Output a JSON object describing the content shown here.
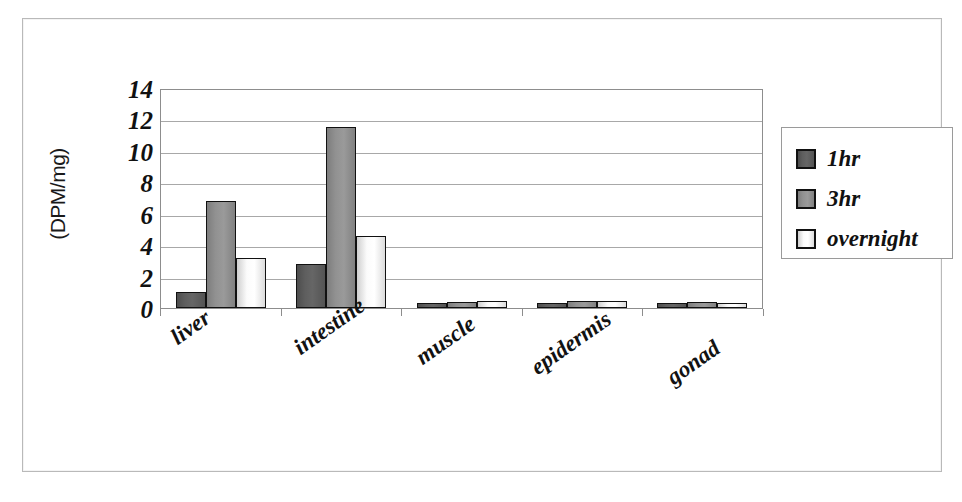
{
  "chart_data": {
    "type": "bar",
    "title": "",
    "xlabel": "",
    "ylabel": "(DPM/mg)",
    "ylim": [
      0,
      14
    ],
    "ytick_step": 2,
    "yticks": [
      14,
      12,
      10,
      8,
      6,
      4,
      2,
      0
    ],
    "grid": "horizontal",
    "legend_position": "right",
    "categories": [
      "liver",
      "intestine",
      "muscle",
      "epidermis",
      "gonad"
    ],
    "series": [
      {
        "name": "1hr",
        "color": "#5e5e5e",
        "values": [
          1.0,
          2.8,
          0.25,
          0.3,
          0.2
        ]
      },
      {
        "name": "3hr",
        "color": "#919191",
        "values": [
          6.8,
          11.5,
          0.4,
          0.45,
          0.4
        ]
      },
      {
        "name": "overnight",
        "color": "#ffffff",
        "values": [
          3.2,
          4.6,
          0.45,
          0.45,
          0.35
        ]
      }
    ]
  },
  "axis": {
    "y_title": "(DPM/mg)",
    "y_tick_labels": [
      "14",
      "12",
      "10",
      "8",
      "6",
      "4",
      "2",
      "0"
    ]
  },
  "legend": {
    "entries": [
      {
        "label": "1hr"
      },
      {
        "label": "3hr"
      },
      {
        "label": "overnight"
      }
    ]
  }
}
